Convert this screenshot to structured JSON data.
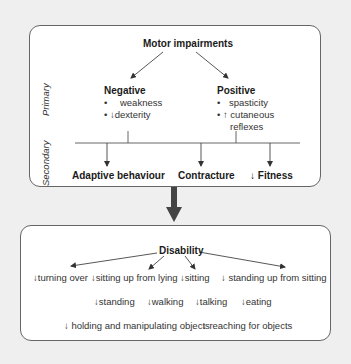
{
  "top_box": {
    "title": "Motor impairments",
    "side_labels": {
      "primary": "Primary",
      "secondary": "Secondary"
    },
    "negative": {
      "heading": "Negative",
      "bullets": [
        {
          "bullet": "•",
          "arrow": "",
          "text": "weakness"
        },
        {
          "bullet": "•",
          "arrow": "down-arrow-icon",
          "text": "dexterity"
        }
      ]
    },
    "positive": {
      "heading": "Positive",
      "bullets": [
        {
          "bullet": "•",
          "arrow": "",
          "text": "spasticity"
        },
        {
          "bullet": "•",
          "arrow": "up-arrow-icon",
          "text": "cutaneous"
        },
        {
          "bullet": "",
          "arrow": "",
          "text": "reflexes"
        }
      ]
    },
    "secondary_outcomes": [
      {
        "label": "Adaptive behaviour",
        "arrow": ""
      },
      {
        "label": "Contracture",
        "arrow": ""
      },
      {
        "label": "Fitness",
        "arrow": "down-arrow-icon"
      }
    ]
  },
  "connector": {
    "icon": "big-down-arrow-icon"
  },
  "bottom_box": {
    "title": "Disability",
    "row1": [
      "turning over",
      "sitting up from lying",
      "sitting",
      "standing up from sitting"
    ],
    "row2": [
      "standing",
      "walking",
      "talking",
      "eating"
    ],
    "row3": [
      "holding and manipulating objects",
      "reaching for objects"
    ],
    "item_prefix_icon": "down-arrow-icon"
  },
  "colors": {
    "background": "#efefef",
    "box_fill": "#ffffff",
    "box_border": "#666666",
    "text": "#333333",
    "big_arrow": "#444444"
  }
}
